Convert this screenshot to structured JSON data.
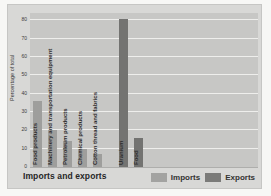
{
  "chart_data": {
    "type": "bar",
    "title": "Imports and exports",
    "ylabel": "Percentage of total",
    "xlabel": "",
    "ylim": [
      0,
      80
    ],
    "yticks": [
      0,
      10,
      20,
      30,
      40,
      50,
      60,
      70,
      80
    ],
    "grid": true,
    "legend_position": "bottom-right",
    "plot_bg": "#c7c7c5",
    "categories": [
      "Food products",
      "Machinery and transportation equipment",
      "Petroleum products",
      "Chemical products",
      "Cotton thread and fabrics",
      "Uranium",
      "Food"
    ],
    "bars": [
      {
        "label": "Food products",
        "series": "Imports",
        "value": 36
      },
      {
        "label": "Machinery and transportation equipment",
        "series": "Imports",
        "value": 20
      },
      {
        "label": "Petroleum products",
        "series": "Imports",
        "value": 14
      },
      {
        "label": "Chemical products",
        "series": "Imports",
        "value": 10
      },
      {
        "label": "Cotton thread and fabrics",
        "series": "Imports",
        "value": 7
      },
      {
        "label": "Uranium",
        "series": "Exports",
        "value": 81
      },
      {
        "label": "Food",
        "series": "Exports",
        "value": 16
      }
    ],
    "series": [
      {
        "name": "Imports",
        "color": "#9e9e9c",
        "values": [
          36,
          20,
          14,
          10,
          7,
          null,
          null
        ]
      },
      {
        "name": "Exports",
        "color": "#737371",
        "values": [
          null,
          null,
          null,
          null,
          null,
          81,
          16
        ]
      }
    ],
    "legend": [
      {
        "label": "Imports",
        "color": "#a3a3a1"
      },
      {
        "label": "Exports",
        "color": "#7b7b79"
      }
    ]
  }
}
